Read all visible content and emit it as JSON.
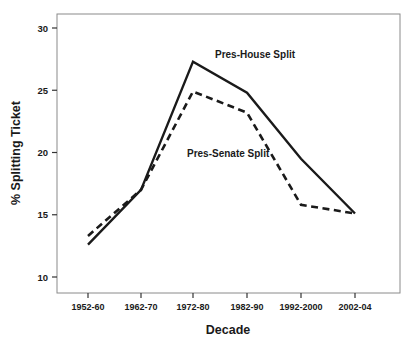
{
  "chart_data": {
    "type": "line",
    "title": "",
    "xlabel": "Decade",
    "ylabel": "% Splitting Ticket",
    "categories": [
      "1952-60",
      "1962-70",
      "1972-80",
      "1982-90",
      "1992-2000",
      "2002-04"
    ],
    "ylim": [
      8.5,
      31.5
    ],
    "yticks": [
      10,
      15,
      20,
      25,
      30
    ],
    "ytick_labels": [
      "10",
      "15",
      "20",
      "25",
      "30"
    ],
    "grid": false,
    "legend_position": "inline-annotations",
    "series": [
      {
        "name": "Pres-House Split",
        "style": "solid",
        "color": "#1a1a1a",
        "values": [
          12.6,
          17.0,
          27.3,
          24.8,
          19.5,
          15.1
        ],
        "annotation": {
          "text": "Pres-House Split",
          "x_category": "1972-80",
          "y_value": 27.6
        }
      },
      {
        "name": "Pres-Senate Split",
        "style": "dashed",
        "color": "#1a1a1a",
        "values": [
          13.3,
          17.0,
          24.9,
          23.2,
          15.8,
          15.1
        ],
        "annotation": {
          "text": "Pres-Senate Split",
          "x_category": "1972-80",
          "y_value": 19.6
        }
      }
    ]
  },
  "axes": {
    "x_axis_title": "Decade",
    "y_axis_title": "% Splitting Ticket",
    "x_tick_labels": [
      "1952-60",
      "1962-70",
      "1972-80",
      "1982-90",
      "1992-2000",
      "2002-04"
    ],
    "y_tick_labels": [
      "10",
      "15",
      "20",
      "25",
      "30"
    ]
  },
  "annotations": {
    "pres_house": "Pres-House Split",
    "pres_senate": "Pres-Senate Split"
  },
  "colors": {
    "line": "#1a1a1a",
    "frame": "#8a8a8a",
    "background": "#ffffff"
  }
}
